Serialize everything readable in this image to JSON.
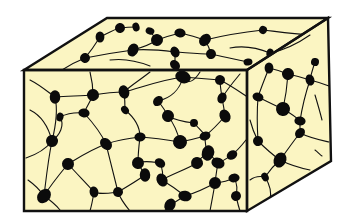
{
  "diagram": {
    "title": "",
    "colors": {
      "fill": "#FBF5C2",
      "stroke": "#111111",
      "node": "#0B0B0B",
      "background": "#FFFFFF"
    },
    "box": {
      "front": [
        [
          24,
          70
        ],
        [
          247,
          70
        ],
        [
          247,
          211
        ],
        [
          24,
          211
        ]
      ],
      "top": [
        [
          24,
          70
        ],
        [
          107,
          18
        ],
        [
          328,
          18
        ],
        [
          247,
          70
        ]
      ],
      "side": [
        [
          247,
          70
        ],
        [
          328,
          18
        ],
        [
          331,
          161
        ],
        [
          247,
          211
        ]
      ]
    },
    "nodes": {
      "front": [
        [
          55,
          97,
          6
        ],
        [
          93,
          95,
          6
        ],
        [
          124,
          92,
          6
        ],
        [
          183,
          77,
          7
        ],
        [
          220,
          80,
          5
        ],
        [
          84,
          113,
          5
        ],
        [
          158,
          101,
          5
        ],
        [
          168,
          116,
          6
        ],
        [
          222,
          98,
          5
        ],
        [
          225,
          116,
          6
        ],
        [
          52,
          141,
          6
        ],
        [
          106,
          144,
          6
        ],
        [
          140,
          137,
          5
        ],
        [
          180,
          142,
          7
        ],
        [
          205,
          136,
          5
        ],
        [
          208,
          153,
          7
        ],
        [
          138,
          163,
          6
        ],
        [
          145,
          175,
          6
        ],
        [
          160,
          163,
          5
        ],
        [
          197,
          163,
          6
        ],
        [
          218,
          163,
          6
        ],
        [
          232,
          155,
          5
        ],
        [
          68,
          164,
          6
        ],
        [
          44,
          196,
          7
        ],
        [
          94,
          192,
          5
        ],
        [
          118,
          192,
          5
        ],
        [
          162,
          180,
          6
        ],
        [
          185,
          196,
          6
        ],
        [
          215,
          183,
          6
        ],
        [
          234,
          178,
          5
        ],
        [
          170,
          205,
          6
        ],
        [
          236,
          196,
          5
        ],
        [
          60,
          117,
          4
        ],
        [
          125,
          110,
          4
        ],
        [
          194,
          123,
          4
        ]
      ],
      "top": [
        [
          100,
          37,
          5
        ],
        [
          120,
          28,
          5
        ],
        [
          136,
          27,
          4
        ],
        [
          150,
          31,
          4
        ],
        [
          157,
          40,
          6
        ],
        [
          180,
          33,
          5
        ],
        [
          205,
          40,
          6
        ],
        [
          211,
          54,
          5
        ],
        [
          133,
          50,
          6
        ],
        [
          175,
          52,
          5
        ],
        [
          85,
          58,
          5
        ],
        [
          175,
          65,
          5
        ],
        [
          248,
          62,
          4
        ],
        [
          263,
          30,
          4
        ],
        [
          310,
          35,
          4
        ],
        [
          270,
          53,
          4
        ]
      ],
      "side": [
        [
          269,
          68,
          5
        ],
        [
          288,
          74,
          6
        ],
        [
          310,
          80,
          5
        ],
        [
          258,
          97,
          5
        ],
        [
          283,
          109,
          7
        ],
        [
          300,
          121,
          5
        ],
        [
          300,
          133,
          5
        ],
        [
          258,
          141,
          5
        ],
        [
          280,
          160,
          7
        ],
        [
          265,
          177,
          4
        ],
        [
          315,
          62,
          4
        ]
      ]
    },
    "fibers": [
      "M30,80 C40,85 48,92 55,97",
      "M55,97 C70,96 82,96 93,95",
      "M93,95 C105,93 115,92 124,92",
      "M124,92 C140,88 160,80 183,77",
      "M183,77 C195,78 208,79 220,80",
      "M220,80 C230,85 240,92 246,96",
      "M55,97 C58,110 56,125 52,141",
      "M52,141 C48,160 46,180 44,196",
      "M44,196 C50,200 56,205 60,210",
      "M93,95 C90,102 86,108 84,113",
      "M84,113 C72,112 64,115 60,117",
      "M84,113 C95,125 102,135 106,144",
      "M106,144 C118,140 130,138 140,137",
      "M140,137 C155,138 168,140 180,142",
      "M180,142 C190,140 198,138 205,136",
      "M205,136 C215,128 220,122 225,116",
      "M225,116 C224,108 223,103 222,98",
      "M222,98 C221,90 220,85 220,80",
      "M183,77 C180,90 170,98 158,101",
      "M158,101 C162,106 166,112 168,116",
      "M168,116 C175,125 178,134 180,142",
      "M124,92 C125,100 125,106 125,110",
      "M125,110 C135,118 140,128 140,137",
      "M106,144 C110,160 115,180 118,192",
      "M106,144 C90,150 78,158 68,164",
      "M68,164 C58,176 50,186 44,196",
      "M68,164 C78,175 88,185 94,192",
      "M94,192 C100,195 110,193 118,192",
      "M118,192 C130,185 138,180 145,175",
      "M145,175 C142,170 140,167 138,163",
      "M138,163 C145,160 153,162 160,163",
      "M160,163 C163,170 163,176 162,180",
      "M162,180 C172,186 180,192 185,196",
      "M185,196 C178,200 174,203 170,205",
      "M170,205 C168,208 166,210 164,211",
      "M185,196 C198,192 208,187 215,183",
      "M215,183 C225,182 230,180 234,178",
      "M234,178 C238,185 237,190 236,196",
      "M208,153 C205,147 205,141 205,136",
      "M208,153 C213,158 216,160 218,163",
      "M218,163 C225,160 229,157 232,155",
      "M197,163 C200,158 205,155 208,153",
      "M197,163 C185,170 170,175 162,180",
      "M215,183 C216,175 217,168 218,163",
      "M232,155 C238,150 242,145 246,140",
      "M138,163 C138,155 139,145 140,137",
      "M52,141 C45,150 35,155 26,158",
      "M52,141 C60,135 65,125 60,117",
      "M194,123 C200,130 204,133 205,136",
      "M194,123 C185,122 175,120 168,116",
      "M30,110 C40,115 48,125 52,141",
      "M28,180 C35,185 40,190 44,196",
      "M90,72 C92,80 93,88 93,95",
      "M150,72 C140,80 130,86 124,92",
      "M200,72 C195,80 188,86 183,77",
      "M240,74 C235,80 228,88 222,98",
      "M90,211 C92,204 93,198 94,192",
      "M130,211 C125,205 120,198 118,192",
      "M210,211 C212,200 214,190 215,183",
      "M240,211 C238,205 237,200 236,196",
      "M100,37 C110,32 115,29 120,28",
      "M120,28 C128,27 132,27 136,27",
      "M150,31 C153,35 155,38 157,40",
      "M157,40 C165,37 172,35 180,33",
      "M180,33 C190,35 198,38 205,40",
      "M205,40 C208,45 210,50 211,54",
      "M133,50 C145,49 160,50 175,52",
      "M175,52 C190,53 200,54 211,54",
      "M85,58 C100,55 118,52 133,50",
      "M175,52 C175,57 175,61 175,65",
      "M175,65 C176,67 178,69 180,70",
      "M100,37 C95,45 90,52 85,58",
      "M85,58 C75,62 68,66 62,70",
      "M211,54 C225,57 238,60 248,62",
      "M205,40 C225,35 245,32 263,30",
      "M263,30 C280,32 295,34 310,35",
      "M270,53 C285,50 300,42 310,35",
      "M157,40 C150,45 140,48 133,50",
      "M110,60 C125,58 140,62 150,66",
      "M230,48 C245,45 258,48 270,53",
      "M269,68 C278,70 283,72 288,74",
      "M288,74 C297,76 304,78 310,80",
      "M269,68 C265,78 261,88 258,97",
      "M258,97 C268,102 276,106 283,109",
      "M283,109 C290,113 296,117 300,121",
      "M300,121 C300,125 300,129 300,133",
      "M300,133 C292,143 286,152 280,160",
      "M280,160 C273,166 269,171 265,177",
      "M258,141 C265,148 273,155 280,160",
      "M258,141 C257,125 257,110 258,97",
      "M288,74 C287,88 285,100 283,109",
      "M310,80 C305,95 302,108 300,121",
      "M315,62 C313,68 311,74 310,80",
      "M310,80 C318,82 324,84 329,86",
      "M300,133 C310,138 320,140 329,142",
      "M280,160 C290,165 300,168 310,170",
      "M250,120 C252,128 255,135 258,141",
      "M250,180 C255,176 260,176 265,177",
      "M265,177 C270,185 272,192 270,200",
      "M315,95 C318,105 320,112 322,120",
      "M315,150 C318,152 320,155 322,156"
    ]
  }
}
